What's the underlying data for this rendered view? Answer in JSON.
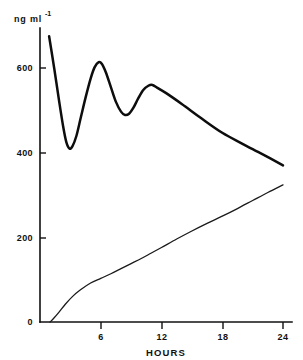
{
  "chart_data": {
    "type": "line",
    "title": "",
    "subtitle": "",
    "xlabel": "HOURS",
    "ylabel": "ng ml",
    "ylabel_exponent": "-1",
    "xlim": [
      0,
      24
    ],
    "ylim": [
      0,
      700
    ],
    "grid": false,
    "legend": "none",
    "x_ticks": [
      0,
      6,
      12,
      18,
      24
    ],
    "x_tick_labels": [
      "0",
      "6",
      "12",
      "18",
      "24"
    ],
    "y_ticks": [
      0,
      200,
      400,
      600
    ],
    "y_tick_labels": [
      "0",
      "200",
      "400",
      "600"
    ],
    "series": [
      {
        "name": "plasma-concentration",
        "style": "thick",
        "x": [
          0.9,
          1.4,
          1.9,
          2.3,
          2.6,
          2.9,
          3.2,
          3.6,
          4.0,
          4.5,
          5.0,
          5.4,
          5.8,
          6.1,
          6.5,
          7.0,
          7.5,
          8.0,
          8.4,
          8.8,
          9.2,
          9.7,
          10.2,
          10.7,
          11.1,
          11.6,
          12.5,
          14.0,
          16.0,
          18.0,
          20.0,
          22.0,
          24.0
        ],
        "values": [
          675,
          600,
          520,
          460,
          425,
          410,
          415,
          440,
          480,
          530,
          575,
          602,
          614,
          610,
          590,
          555,
          520,
          497,
          489,
          492,
          505,
          528,
          548,
          558,
          560,
          553,
          540,
          515,
          480,
          447,
          421,
          396,
          370
        ]
      },
      {
        "name": "urinary-excretion",
        "style": "thin",
        "x": [
          1.0,
          1.4,
          1.9,
          2.5,
          3.2,
          4.0,
          5.0,
          6.0,
          7.0,
          8.0,
          9.0,
          10.0,
          11.0,
          12.0,
          13.5,
          15.0,
          16.5,
          18.0,
          19.5,
          21.0,
          22.5,
          24.0
        ],
        "values": [
          0,
          10,
          24,
          42,
          60,
          76,
          92,
          103,
          114,
          126,
          138,
          150,
          163,
          176,
          196,
          215,
          233,
          250,
          268,
          287,
          306,
          324
        ]
      }
    ]
  },
  "axes": {
    "unit_prefix": "ng ml",
    "unit_superscript": "-1",
    "x_axis_title": "HOURS"
  },
  "colors": {
    "ink": "#111111",
    "background": "#ffffff",
    "primary_series": "#0d0d0d",
    "secondary_series": "#1a1a1a"
  }
}
